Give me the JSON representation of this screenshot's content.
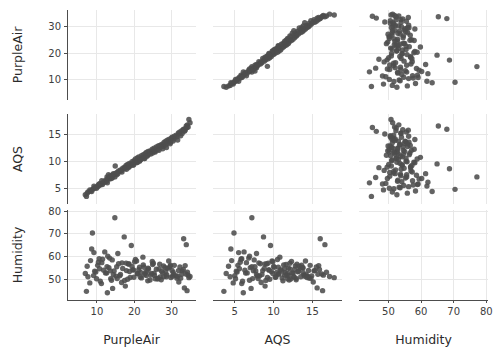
{
  "chart_data": {
    "type": "scatter",
    "title": "",
    "subtitle": "",
    "layout": "scatter-plot-matrix",
    "matrix_size": 3,
    "grid": true,
    "legend": null,
    "diagonal_panels": "blank",
    "variables": [
      {
        "name": "PurpleAir",
        "label": "PurpleAir",
        "ticks": [
          10,
          20,
          30
        ],
        "lim": [
          2.0,
          36.5
        ]
      },
      {
        "name": "AQS",
        "label": "AQS",
        "ticks": [
          5,
          10,
          15
        ],
        "lim": [
          2.2,
          18.8
        ]
      },
      {
        "name": "Humidity",
        "label": "Humidity",
        "ticks": [
          50,
          60,
          70,
          80
        ],
        "lim": [
          41.0,
          80.5
        ]
      }
    ],
    "row_labels": [
      "PurpleAir",
      "AQS",
      "Humidity"
    ],
    "column_labels": [
      "PurpleAir",
      "AQS",
      "Humidity"
    ],
    "xlabel": "",
    "ylabel": "",
    "point_color": "#4d4d4d",
    "grid_color": "#e8e8e8",
    "axis_color": "#4d4d4d",
    "background": "#ffffff",
    "n_points": 140,
    "series": [
      {
        "name": "observations",
        "PurpleAir": [
          7.6,
          8.1,
          7.2,
          9.4,
          8.8,
          10.2,
          11.5,
          9.9,
          12.1,
          10.7,
          13.4,
          11.2,
          14.8,
          12.6,
          15.3,
          13.9,
          16.7,
          14.2,
          17.9,
          15.6,
          18.4,
          16.1,
          19.8,
          17.3,
          20.6,
          18.9,
          21.4,
          19.2,
          22.8,
          20.1,
          23.6,
          21.7,
          24.9,
          22.3,
          25.4,
          23.8,
          26.2,
          24.6,
          27.8,
          25.1,
          28.4,
          26.9,
          29.7,
          27.2,
          30.6,
          28.8,
          31.4,
          29.3,
          32.8,
          30.2,
          33.6,
          31.9,
          34.4,
          33.1,
          34.9,
          34.6,
          34.2,
          33.8,
          6.9,
          7.4,
          8.3,
          9.1,
          9.7,
          10.4,
          10.9,
          11.8,
          12.3,
          12.9,
          13.2,
          13.7,
          14.1,
          14.6,
          15.1,
          15.8,
          16.3,
          16.9,
          17.4,
          17.8,
          18.2,
          18.7,
          19.4,
          19.9,
          20.3,
          20.8,
          21.2,
          21.9,
          22.4,
          22.9,
          23.2,
          23.7,
          24.2,
          24.8,
          25.3,
          25.9,
          26.4,
          26.8,
          27.3,
          27.9,
          28.2,
          28.7,
          29.2,
          29.8,
          30.1,
          30.7,
          31.2,
          31.8,
          32.2,
          32.7,
          33.2,
          33.9,
          8.6,
          9.2,
          10.6,
          11.3,
          12.7,
          13.6,
          14.4,
          15.4,
          16.6,
          17.6,
          18.6,
          19.6,
          20.9,
          21.6,
          22.6,
          23.4,
          24.4,
          25.6,
          26.6,
          27.6,
          28.6,
          29.6,
          30.4,
          31.6,
          32.4,
          33.4,
          34.1,
          12.8,
          13.1,
          14.9
        ],
        "AQS": [
          4.4,
          4.8,
          3.6,
          5.2,
          4.9,
          5.4,
          5.8,
          5.1,
          6.2,
          5.6,
          6.8,
          5.9,
          7.2,
          6.4,
          7.6,
          6.9,
          8.1,
          7.1,
          8.6,
          7.8,
          8.9,
          8.2,
          9.4,
          8.7,
          9.8,
          9.2,
          10.1,
          9.6,
          10.6,
          9.9,
          11.2,
          10.4,
          11.6,
          10.8,
          11.9,
          11.4,
          12.2,
          11.8,
          12.8,
          12.1,
          13.1,
          12.6,
          13.6,
          12.9,
          14.2,
          13.4,
          14.6,
          13.8,
          15.2,
          14.4,
          15.8,
          15.1,
          16.4,
          15.9,
          17.2,
          17.8,
          16.8,
          16.2,
          3.9,
          4.2,
          4.6,
          5.0,
          5.3,
          5.7,
          6.0,
          6.3,
          6.6,
          6.9,
          7.0,
          7.3,
          7.5,
          7.7,
          7.9,
          8.3,
          8.5,
          8.8,
          9.0,
          9.3,
          9.5,
          9.7,
          10.0,
          10.2,
          10.5,
          10.7,
          10.9,
          11.1,
          11.3,
          11.5,
          11.7,
          11.9,
          12.0,
          12.3,
          12.5,
          12.7,
          12.9,
          13.0,
          13.2,
          13.5,
          13.7,
          13.9,
          14.1,
          14.3,
          14.5,
          14.7,
          14.9,
          15.3,
          15.5,
          15.7,
          16.0,
          16.6,
          4.5,
          5.5,
          5.9,
          6.5,
          7.2,
          7.4,
          7.8,
          8.0,
          8.4,
          8.9,
          9.1,
          9.4,
          9.9,
          10.3,
          10.6,
          11.0,
          11.4,
          11.8,
          12.1,
          12.4,
          12.6,
          13.3,
          13.8,
          14.0,
          14.8,
          15.6,
          16.3,
          6.1,
          7.6,
          9.2
        ],
        "Humidity": [
          51.2,
          48.5,
          44.8,
          53.6,
          70.4,
          56.2,
          58.9,
          50.3,
          62.1,
          54.7,
          59.4,
          48.2,
          77.1,
          52.8,
          55.6,
          49.7,
          57.3,
          46.1,
          53.9,
          61.4,
          56.8,
          51.6,
          54.2,
          68.7,
          58.1,
          50.9,
          55.4,
          64.9,
          52.3,
          57.8,
          49.4,
          53.1,
          56.6,
          59.8,
          51.8,
          54.6,
          50.2,
          52.7,
          55.9,
          57.1,
          53.4,
          51.1,
          56.3,
          49.9,
          52.1,
          54.9,
          50.6,
          55.1,
          53.8,
          51.4,
          56.1,
          48.9,
          51.9,
          54.4,
          51.3,
          50.8,
          53.2,
          52.4,
          52.6,
          55.8,
          58.3,
          51.7,
          53.3,
          57.6,
          49.2,
          54.1,
          52.9,
          60.2,
          55.2,
          50.4,
          58.6,
          53.7,
          51.5,
          56.9,
          52.2,
          54.8,
          49.6,
          57.2,
          50.1,
          53.5,
          55.7,
          51.0,
          58.8,
          52.5,
          54.3,
          50.7,
          56.4,
          53.0,
          51.8,
          55.0,
          49.8,
          57.9,
          52.8,
          54.5,
          50.5,
          56.7,
          53.6,
          51.2,
          55.3,
          52.0,
          58.1,
          50.9,
          54.0,
          56.2,
          51.6,
          53.9,
          55.5,
          52.3,
          67.9,
          65.3,
          63.4,
          61.8,
          59.1,
          57.4,
          55.6,
          53.8,
          52.1,
          50.4,
          48.7,
          47.1,
          56.8,
          54.2,
          52.6,
          51.1,
          55.4,
          53.7,
          52.0,
          50.3,
          54.6,
          52.9,
          51.2,
          55.8,
          53.1,
          51.4,
          50.6,
          46.3,
          45.1,
          44.2
        ]
      }
    ]
  }
}
